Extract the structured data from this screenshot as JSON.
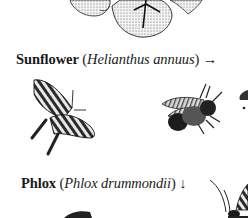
{
  "captions": [
    {
      "common_name": "Sunflower",
      "open_paren": " (",
      "scientific_name": "Helianthus annuus",
      "close_paren": ")",
      "arrow": " →"
    },
    {
      "common_name": "Phlox",
      "open_paren": " (",
      "scientific_name": "Phlox drummondii",
      "close_paren": ")",
      "arrow": " ↓"
    }
  ],
  "illustrations": [
    {
      "subject": "phlox-flower"
    },
    {
      "subject": "swallowtail-butterfly"
    },
    {
      "subject": "bee"
    },
    {
      "subject": "butterfly-partial"
    },
    {
      "subject": "insect-partial"
    }
  ]
}
